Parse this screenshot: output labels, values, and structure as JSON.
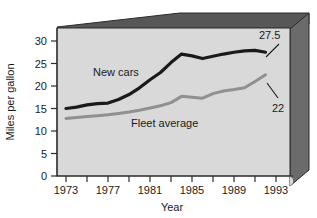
{
  "chart_data": {
    "type": "line",
    "title": "",
    "xlabel": "Year",
    "ylabel": "Miles per gallon",
    "xlim": [
      1973,
      1995
    ],
    "ylim": [
      0,
      33
    ],
    "grid": false,
    "legend_position": "inline-labels",
    "xticks_major": [
      1973,
      1977,
      1981,
      1985,
      1989,
      1993
    ],
    "xticks_minor": [
      1975,
      1979,
      1983,
      1987,
      1991
    ],
    "yticks": [
      0,
      5,
      10,
      15,
      20,
      25,
      30
    ],
    "x": [
      1973,
      1974,
      1975,
      1976,
      1977,
      1978,
      1979,
      1980,
      1981,
      1982,
      1983,
      1984,
      1985,
      1986,
      1987,
      1988,
      1989,
      1990,
      1991,
      1992
    ],
    "series": [
      {
        "name": "New cars",
        "color": "#1a1a1a",
        "label_text": "New cars",
        "values": [
          15.0,
          15.3,
          15.8,
          16.1,
          16.2,
          17.0,
          18.1,
          19.6,
          21.4,
          23.0,
          25.2,
          27.1,
          26.7,
          26.1,
          26.6,
          27.1,
          27.5,
          27.8,
          27.9,
          27.5
        ],
        "end_annotation": "27.5"
      },
      {
        "name": "Fleet average",
        "color": "#909090",
        "label_text": "Fleet average",
        "values": [
          12.8,
          13.0,
          13.2,
          13.4,
          13.6,
          13.9,
          14.2,
          14.6,
          15.1,
          15.6,
          16.3,
          17.7,
          17.5,
          17.3,
          18.3,
          18.9,
          19.2,
          19.6,
          21.0,
          22.5
        ],
        "end_annotation": "22"
      }
    ],
    "annotations": [
      {
        "id": "new-cars-value",
        "text": "27.5",
        "value": 27.5
      },
      {
        "id": "fleet-average-value",
        "text": "22",
        "value": 22
      }
    ]
  },
  "axes": {
    "y_title": "Miles per gallon",
    "x_title": "Year",
    "y_tick_labels": [
      "0",
      "5",
      "10",
      "15",
      "20",
      "25",
      "30"
    ],
    "x_tick_labels": [
      "1973",
      "1977",
      "1981",
      "1985",
      "1989",
      "1993"
    ]
  },
  "labels": {
    "new_cars": "New cars",
    "fleet_average": "Fleet average",
    "annotation_new_cars": "27.5",
    "annotation_fleet_average": "22"
  },
  "colors": {
    "new_cars_line": "#1a1a1a",
    "fleet_average_line": "#909090",
    "plot_background": "#d9d9d9",
    "frame_top_bevel": "#575757",
    "frame_right_bevel": "#6b6b6b",
    "frame_edge": "#2b2b2b",
    "page_background": "#ffffff",
    "text": "#1a1a1a"
  }
}
